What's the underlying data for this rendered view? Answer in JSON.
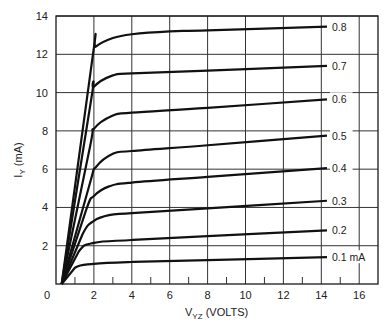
{
  "chart_data": {
    "type": "line",
    "title": "",
    "xlabel": "V_YZ (VOLTS)",
    "ylabel": "I_Y (mA)",
    "xlabel_main": "V",
    "xlabel_sub": "YZ",
    "xlabel_rest": " (VOLTS)",
    "ylabel_main": "I",
    "ylabel_sub": "Y",
    "ylabel_rest": " (mA)",
    "xlim": [
      0,
      17
    ],
    "ylim": [
      0,
      14
    ],
    "xticks": [
      0,
      2,
      4,
      6,
      8,
      10,
      12,
      14,
      16
    ],
    "yticks": [
      2,
      4,
      6,
      8,
      10,
      12,
      14
    ],
    "grid": true,
    "legend": "inline labels at right end of each curve",
    "series": [
      {
        "name": "0.1 mA",
        "label": "0.1 mA",
        "x": [
          0.3,
          1.0,
          2.0,
          4.0,
          8.0,
          14.3
        ],
        "y": [
          0,
          0.85,
          1.05,
          1.15,
          1.25,
          1.4
        ]
      },
      {
        "name": "0.2",
        "label": "0.2",
        "x": [
          0.3,
          1.2,
          2.0,
          4.0,
          8.0,
          14.3
        ],
        "y": [
          0,
          1.7,
          2.15,
          2.3,
          2.5,
          2.8
        ]
      },
      {
        "name": "0.3",
        "label": "0.3",
        "x": [
          0.3,
          1.4,
          2.0,
          2.8,
          4.0,
          8.0,
          14.3
        ],
        "y": [
          0,
          2.6,
          3.3,
          3.6,
          3.7,
          3.95,
          4.35
        ]
      },
      {
        "name": "0.4",
        "label": "0.4",
        "x": [
          0.3,
          1.6,
          2.0,
          2.8,
          4.0,
          8.0,
          14.3
        ],
        "y": [
          0,
          3.9,
          4.6,
          5.1,
          5.3,
          5.6,
          6.05
        ]
      },
      {
        "name": "0.5",
        "label": "0.5",
        "x": [
          0.3,
          1.8,
          2.1,
          3.0,
          4.0,
          8.0,
          14.3
        ],
        "y": [
          0,
          5.3,
          6.1,
          6.8,
          6.95,
          7.25,
          7.75
        ]
      },
      {
        "name": "0.6",
        "label": "0.6",
        "x": [
          0.3,
          1.8,
          2.0,
          3.0,
          4.0,
          8.0,
          14.3
        ],
        "y": [
          0,
          7.2,
          8.1,
          8.8,
          8.95,
          9.2,
          9.65
        ]
      },
      {
        "name": "0.7",
        "label": "0.7",
        "x": [
          0.3,
          1.85,
          2.0,
          3.0,
          4.0,
          8.0,
          14.3
        ],
        "y": [
          0,
          9.6,
          10.3,
          10.9,
          11.0,
          11.15,
          11.4
        ]
      },
      {
        "name": "0.8",
        "label": "0.8",
        "x": [
          0.3,
          1.95,
          2.1,
          3.0,
          4.0,
          6.0,
          8.0,
          14.3
        ],
        "y": [
          0,
          12.0,
          12.4,
          12.85,
          13.05,
          13.2,
          13.25,
          13.45
        ]
      }
    ]
  }
}
